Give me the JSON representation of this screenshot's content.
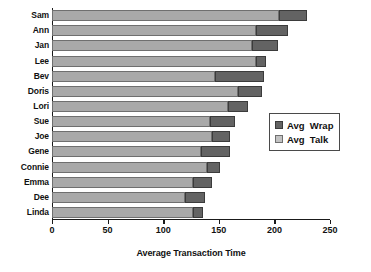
{
  "chart_data": {
    "type": "bar",
    "orientation": "horizontal",
    "stacked": true,
    "title": "",
    "xlabel": "Average Transaction Time",
    "ylabel": "",
    "xlim": [
      0,
      250
    ],
    "xticks": [
      0,
      50,
      100,
      150,
      200,
      250
    ],
    "grid": false,
    "legend_position": "right",
    "categories": [
      "Sam",
      "Ann",
      "Jan",
      "Lee",
      "Bev",
      "Doris",
      "Lori",
      "Sue",
      "Joe",
      "Gene",
      "Connie",
      "Emma",
      "Dee",
      "Linda"
    ],
    "series": [
      {
        "name": "Avg  Talk",
        "color": "#a9a9a9",
        "values": [
          204,
          183,
          180,
          183,
          147,
          167,
          158,
          142,
          144,
          134,
          139,
          127,
          120,
          127
        ]
      },
      {
        "name": "Avg  Wrap",
        "color": "#636363",
        "values": [
          25,
          29,
          23,
          9,
          44,
          22,
          18,
          23,
          16,
          26,
          12,
          17,
          18,
          9
        ]
      }
    ],
    "totals": [
      229,
      212,
      203,
      192,
      191,
      189,
      176,
      165,
      160,
      160,
      151,
      144,
      138,
      136
    ]
  },
  "legend": {
    "items": [
      {
        "label": "Avg  Wrap",
        "swatch": "dark-swatch"
      },
      {
        "label": "Avg  Talk",
        "swatch": "light-swatch"
      }
    ]
  },
  "axis": {
    "x_title": "Average Transaction Time",
    "x_tick_labels": [
      "0",
      "50",
      "100",
      "150",
      "200",
      "250"
    ]
  },
  "colors": {
    "talk": "#a9a9a9",
    "wrap": "#636363",
    "axis": "#1a1a1a",
    "background": "#ffffff"
  }
}
